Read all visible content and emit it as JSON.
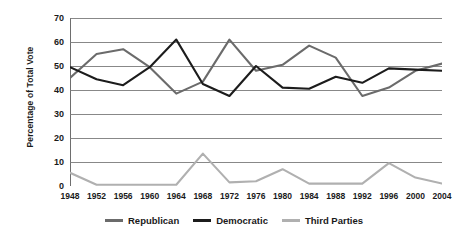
{
  "chart_data": {
    "type": "line",
    "title": "",
    "xlabel": "",
    "ylabel": "Percentage of Total Vote",
    "ylim": [
      0,
      70
    ],
    "ytick_step": 10,
    "yticks": [
      70,
      60,
      50,
      40,
      30,
      20,
      10,
      0
    ],
    "grid": true,
    "grid_axis": "y",
    "legend_position": "bottom",
    "categories": [
      "1948",
      "1952",
      "1956",
      "1960",
      "1964",
      "1968",
      "1972",
      "1976",
      "1980",
      "1984",
      "1988",
      "1992",
      "1996",
      "2000",
      "2004"
    ],
    "series": [
      {
        "name": "Republican",
        "color": "#6b6b6b",
        "values": [
          45,
          55,
          57,
          49.5,
          38.5,
          43.5,
          61,
          48,
          50.5,
          58.5,
          53.5,
          37.5,
          41,
          48,
          51
        ]
      },
      {
        "name": "Democratic",
        "color": "#1c1c1c",
        "values": [
          49.5,
          44.5,
          42,
          49.5,
          61,
          42.5,
          37.5,
          50,
          41,
          40.5,
          45.5,
          43,
          49,
          48.5,
          48
        ]
      },
      {
        "name": "Third Parties",
        "color": "#b0b0b0",
        "values": [
          5.5,
          0.5,
          0.5,
          0.5,
          0.5,
          13.5,
          1.5,
          2,
          7,
          1,
          1,
          1,
          9.5,
          3.5,
          1
        ]
      }
    ]
  },
  "legend": {
    "items": [
      {
        "label": "Republican"
      },
      {
        "label": "Democratic"
      },
      {
        "label": "Third Parties"
      }
    ]
  },
  "axis": {
    "y_title": "Percentage of Total Vote"
  },
  "colors": {
    "republican": "#6b6b6b",
    "democratic": "#1c1c1c",
    "third_parties": "#b0b0b0",
    "gridline": "#7a7a7a",
    "axis": "#6e6e6e",
    "text": "#1a1a1a",
    "background": "#ffffff"
  }
}
